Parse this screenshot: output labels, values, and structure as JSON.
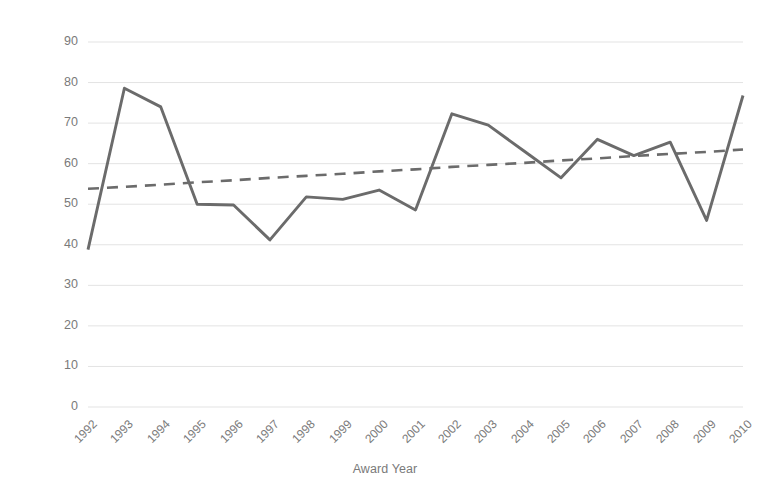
{
  "chart_data": {
    "type": "line",
    "title": "",
    "xlabel": "Award Year",
    "ylabel": "Percent of NIH Projects Involving a University",
    "categories": [
      "1992",
      "1993",
      "1994",
      "1995",
      "1996",
      "1997",
      "1998",
      "1999",
      "2000",
      "2001",
      "2002",
      "2003",
      "2004",
      "2005",
      "2006",
      "2007",
      "2008",
      "2009",
      "2010"
    ],
    "series": [
      {
        "name": "Percent of NIH Projects Involving a University",
        "style": "solid",
        "color": "#6b6b6b",
        "values": [
          38.8,
          78.6,
          74.0,
          50.0,
          49.8,
          41.2,
          51.8,
          51.2,
          53.5,
          48.6,
          72.3,
          69.5,
          63.0,
          56.5,
          66.0,
          62.0,
          65.3,
          46.0,
          76.8
        ]
      },
      {
        "name": "Linear trendline",
        "style": "dashed",
        "color": "#6b6b6b",
        "values": [
          53.8,
          54.3,
          54.8,
          55.4,
          55.9,
          56.5,
          57.0,
          57.5,
          58.1,
          58.6,
          59.2,
          59.7,
          60.2,
          60.8,
          61.3,
          61.9,
          62.4,
          62.9,
          63.5
        ]
      }
    ],
    "ylim": [
      0,
      90
    ],
    "ytick_values": [
      0,
      10,
      20,
      30,
      40,
      50,
      60,
      70,
      80,
      90
    ],
    "ytick_labels": [
      "0",
      "10",
      "20",
      "30",
      "40",
      "50",
      "60",
      "70",
      "80",
      "90"
    ],
    "grid": true,
    "grid_color": "#e3e3e3",
    "legend": "none",
    "axis_color": "#d9d9d9",
    "background": "#ffffff"
  }
}
